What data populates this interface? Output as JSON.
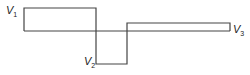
{
  "diagram": {
    "labels": [
      {
        "id": "v1",
        "text": "V",
        "sub": "1"
      },
      {
        "id": "v2",
        "text": "V",
        "sub": "2"
      },
      {
        "id": "v3",
        "text": "V",
        "sub": "3"
      }
    ],
    "stroke_color": "#444444"
  }
}
